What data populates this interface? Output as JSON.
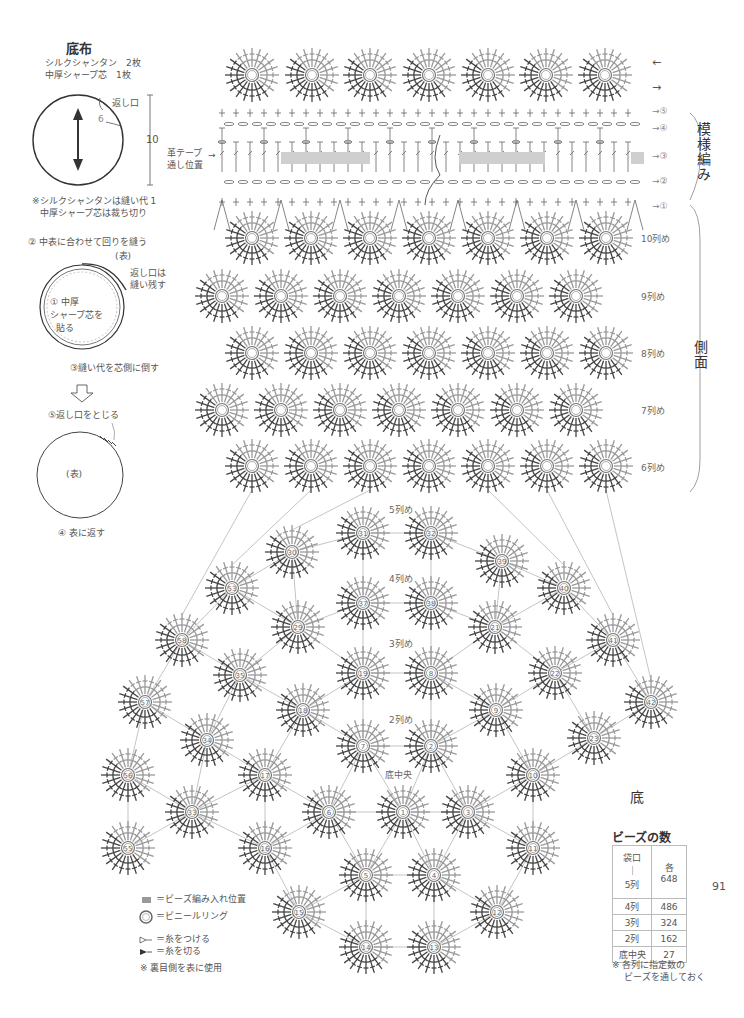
{
  "left_panel": {
    "title": "底布",
    "materials": [
      "シルクシャンタン　2枚",
      "中厚シャープ芯　1枚"
    ],
    "circle_label_opening": "返し口",
    "circle_dim_small": "6",
    "circle_dim_large": "10",
    "note_lines": [
      "※シルクシャンタンは縫い代 1",
      "中厚シャープ芯は裁ち切り"
    ],
    "step2": "② 中表に合わせて回りを縫う",
    "face_label": "(表)",
    "opening_note": [
      "返し口は",
      "縫い残す"
    ],
    "step1": [
      "① 中厚",
      "シャープ芯を",
      "貼る"
    ],
    "step3": "③縫い代を芯側に倒す",
    "step5": "⑤返し口をとじる",
    "face_label2": "(表)",
    "step4": "④ 表に返す"
  },
  "pattern": {
    "tape_label": [
      "革テープ",
      "通し位置"
    ],
    "right_arrows": [
      "←",
      "→"
    ],
    "round_markers": [
      "→⑤",
      "→④",
      "→③",
      "→②",
      "→①"
    ],
    "section_pattern": "模様編み",
    "section_side": "側面",
    "section_bottom": "底",
    "side_rows": [
      "10列め",
      "9列め",
      "8列め",
      "7列め",
      "6列め"
    ],
    "bottom_rows": [
      "5列め",
      "4列め",
      "3列め",
      "2列め"
    ],
    "bottom_center": "底中央"
  },
  "motifs": {
    "top_row": [
      {
        "x": 252,
        "y": 75,
        "n": ""
      },
      {
        "x": 312,
        "y": 75,
        "n": ""
      },
      {
        "x": 370,
        "y": 75,
        "n": ""
      },
      {
        "x": 429,
        "y": 75,
        "n": ""
      },
      {
        "x": 488,
        "y": 75,
        "n": ""
      },
      {
        "x": 546,
        "y": 75,
        "n": ""
      },
      {
        "x": 605,
        "y": 75,
        "n": ""
      }
    ],
    "side": [
      {
        "x": 252,
        "y": 238
      },
      {
        "x": 311,
        "y": 238
      },
      {
        "x": 370,
        "y": 238
      },
      {
        "x": 429,
        "y": 238
      },
      {
        "x": 488,
        "y": 238
      },
      {
        "x": 547,
        "y": 238
      },
      {
        "x": 606,
        "y": 238
      },
      {
        "x": 222,
        "y": 296
      },
      {
        "x": 281,
        "y": 296
      },
      {
        "x": 340,
        "y": 296
      },
      {
        "x": 399,
        "y": 296
      },
      {
        "x": 458,
        "y": 296
      },
      {
        "x": 517,
        "y": 296
      },
      {
        "x": 576,
        "y": 296
      },
      {
        "x": 252,
        "y": 353
      },
      {
        "x": 311,
        "y": 353
      },
      {
        "x": 370,
        "y": 353
      },
      {
        "x": 429,
        "y": 353
      },
      {
        "x": 488,
        "y": 353
      },
      {
        "x": 547,
        "y": 353
      },
      {
        "x": 606,
        "y": 353
      },
      {
        "x": 222,
        "y": 410
      },
      {
        "x": 281,
        "y": 410
      },
      {
        "x": 340,
        "y": 410
      },
      {
        "x": 399,
        "y": 410
      },
      {
        "x": 458,
        "y": 410
      },
      {
        "x": 517,
        "y": 410
      },
      {
        "x": 576,
        "y": 410
      },
      {
        "x": 252,
        "y": 466
      },
      {
        "x": 311,
        "y": 466
      },
      {
        "x": 370,
        "y": 466
      },
      {
        "x": 429,
        "y": 466
      },
      {
        "x": 488,
        "y": 466
      },
      {
        "x": 547,
        "y": 466
      },
      {
        "x": 606,
        "y": 466
      }
    ],
    "bottom": [
      {
        "x": 363,
        "y": 533,
        "n": "31"
      },
      {
        "x": 431,
        "y": 533,
        "n": "32"
      },
      {
        "x": 502,
        "y": 561,
        "n": "39"
      },
      {
        "x": 292,
        "y": 552,
        "n": "30"
      },
      {
        "x": 232,
        "y": 588,
        "n": "53"
      },
      {
        "x": 564,
        "y": 588,
        "n": "40"
      },
      {
        "x": 363,
        "y": 603,
        "n": "37"
      },
      {
        "x": 431,
        "y": 603,
        "n": "38"
      },
      {
        "x": 298,
        "y": 627,
        "n": "29"
      },
      {
        "x": 495,
        "y": 627,
        "n": "21"
      },
      {
        "x": 182,
        "y": 640,
        "n": "58"
      },
      {
        "x": 613,
        "y": 640,
        "n": "41"
      },
      {
        "x": 240,
        "y": 675,
        "n": "35"
      },
      {
        "x": 363,
        "y": 673,
        "n": "19"
      },
      {
        "x": 431,
        "y": 673,
        "n": "8"
      },
      {
        "x": 555,
        "y": 673,
        "n": "22"
      },
      {
        "x": 145,
        "y": 702,
        "n": "57"
      },
      {
        "x": 651,
        "y": 702,
        "n": "42"
      },
      {
        "x": 303,
        "y": 710,
        "n": "18"
      },
      {
        "x": 496,
        "y": 710,
        "n": "9"
      },
      {
        "x": 207,
        "y": 740,
        "n": "34"
      },
      {
        "x": 363,
        "y": 746,
        "n": "7"
      },
      {
        "x": 431,
        "y": 746,
        "n": "2"
      },
      {
        "x": 594,
        "y": 738,
        "n": "23"
      },
      {
        "x": 128,
        "y": 775,
        "n": "56"
      },
      {
        "x": 265,
        "y": 775,
        "n": "17"
      },
      {
        "x": 533,
        "y": 775,
        "n": "10"
      },
      {
        "x": 192,
        "y": 812,
        "n": "33"
      },
      {
        "x": 329,
        "y": 812,
        "n": "6"
      },
      {
        "x": 403,
        "y": 812,
        "n": "1"
      },
      {
        "x": 468,
        "y": 812,
        "n": "3"
      },
      {
        "x": 128,
        "y": 848,
        "n": "55"
      },
      {
        "x": 265,
        "y": 848,
        "n": "16"
      },
      {
        "x": 533,
        "y": 848,
        "n": "11"
      },
      {
        "x": 366,
        "y": 875,
        "n": "5"
      },
      {
        "x": 434,
        "y": 875,
        "n": "4"
      },
      {
        "x": 299,
        "y": 912,
        "n": "15"
      },
      {
        "x": 497,
        "y": 912,
        "n": "12"
      },
      {
        "x": 366,
        "y": 947,
        "n": "14"
      },
      {
        "x": 434,
        "y": 947,
        "n": "13"
      }
    ]
  },
  "beads_table": {
    "title": "ビーズの数",
    "rows": [
      {
        "label": "袋口\n｜\n5列",
        "value": "各\n648"
      },
      {
        "label": "4列",
        "value": "486"
      },
      {
        "label": "3列",
        "value": "324"
      },
      {
        "label": "2列",
        "value": "162"
      },
      {
        "label": "底中央",
        "value": "27"
      }
    ],
    "note": [
      "※ 各列に指定数の",
      "ビーズを通しておく"
    ]
  },
  "legend": {
    "items": [
      {
        "icon": "bead-position-swatch",
        "label": "＝ビーズ編み入れ位置"
      },
      {
        "icon": "vinyl-ring-icon",
        "label": "＝ビニールリング"
      },
      {
        "icon": "attach-yarn-icon",
        "label": "＝糸をつける"
      },
      {
        "icon": "cut-yarn-icon",
        "label": "＝糸を切る"
      }
    ],
    "note": "※ 裏目側を表に使用"
  },
  "page_number": "91",
  "colors": {
    "ink": "#444444",
    "light_ink": "#8a8a8a",
    "bead_band": "#c8c8c8",
    "line": "#999999"
  }
}
